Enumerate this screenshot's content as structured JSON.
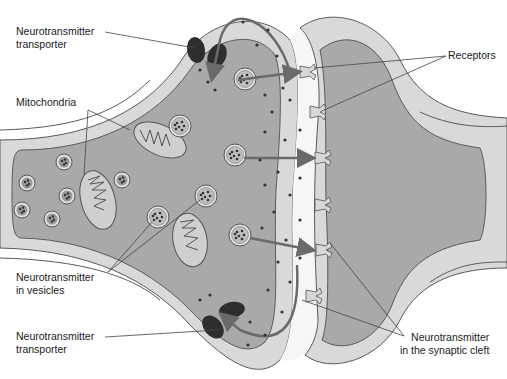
{
  "diagram": {
    "colors": {
      "cytoplasm": "#a9a9a9",
      "membrane_outer": "#d8d8d8",
      "membrane_line": "#5a5a5a",
      "cleft": "#f4f4f4",
      "transporter": "#2e2e2e",
      "arrow": "#6a6a6a",
      "dot": "#3a3a3a",
      "leader": "#444444"
    },
    "labels": {
      "transporter_top": [
        "Neurotransmitter",
        "transporter"
      ],
      "mitochondria": [
        "Mitochondria"
      ],
      "vesicles": [
        "Neurotransmitter",
        "in vesicles"
      ],
      "transporter_bottom": [
        "Neurotransmitter",
        "transporter"
      ],
      "receptors": [
        "Receptors"
      ],
      "cleft": [
        "Neurotransmitter",
        "in the synaptic cleft"
      ]
    },
    "components": [
      "presynaptic-terminal",
      "postsynaptic-dendrite",
      "synaptic-cleft",
      "mitochondria",
      "synaptic-vesicles",
      "neurotransmitter-transporters",
      "receptors",
      "neurotransmitter-molecules"
    ]
  }
}
